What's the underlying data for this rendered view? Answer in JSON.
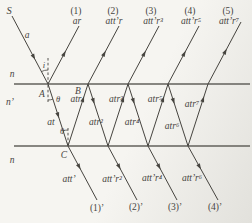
{
  "diagram": {
    "width": 252,
    "height": 223,
    "background": "#f6f5f1",
    "background_edge": "#e2e1dc",
    "ink": "#46443f",
    "surface_color": "#62605b",
    "surfaces": [
      {
        "name": "top-interface-line",
        "x1": 14,
        "y1": 84,
        "x2": 250,
        "y2": 84
      },
      {
        "name": "bottom-interface-line",
        "x1": 14,
        "y1": 146,
        "x2": 250,
        "y2": 146
      }
    ],
    "normals": [
      {
        "name": "normal-above-A",
        "x1": 48,
        "y1": 58,
        "x2": 48,
        "y2": 83
      },
      {
        "name": "normal-below-A",
        "x1": 48,
        "y1": 85,
        "x2": 48,
        "y2": 102
      },
      {
        "name": "normal-above-C",
        "x1": 68,
        "y1": 128,
        "x2": 68,
        "y2": 145
      }
    ],
    "arcs": [
      {
        "name": "incidence-angle-arc",
        "x1": 41.4,
        "y1": 71.6,
        "x2": 48,
        "y2": 70,
        "r": 14,
        "sweep": 1
      },
      {
        "name": "refraction-angle-arc-A",
        "x1": 48,
        "y1": 100,
        "x2": 52.9,
        "y2": 99.2,
        "r": 16,
        "sweep": 0
      },
      {
        "name": "refraction-angle-arc-C",
        "x1": 63.1,
        "y1": 130.8,
        "x2": 68,
        "y2": 130,
        "r": 16,
        "sweep": 1
      }
    ],
    "rays": [
      {
        "name": "incident-ray",
        "x1": 12,
        "y1": 16,
        "x2": 48,
        "y2": 84,
        "arrow_t": 0.6
      },
      {
        "name": "reflected-ray-1",
        "x1": 48,
        "y1": 84,
        "x2": 79,
        "y2": 26,
        "arrow_t": 0.52
      },
      {
        "name": "reflected-ray-2",
        "x1": 88,
        "y1": 84,
        "x2": 119,
        "y2": 26,
        "arrow_t": 0.52
      },
      {
        "name": "reflected-ray-3",
        "x1": 128,
        "y1": 84,
        "x2": 159,
        "y2": 26,
        "arrow_t": 0.52
      },
      {
        "name": "reflected-ray-4",
        "x1": 168,
        "y1": 84,
        "x2": 199,
        "y2": 26,
        "arrow_t": 0.52
      },
      {
        "name": "reflected-ray-5",
        "x1": 208,
        "y1": 84,
        "x2": 241,
        "y2": 22,
        "arrow_t": 0.52
      },
      {
        "name": "internal-ray-down-1",
        "x1": 48,
        "y1": 84,
        "x2": 68,
        "y2": 146,
        "arrow_t": 0.5
      },
      {
        "name": "internal-ray-up-1",
        "x1": 68,
        "y1": 146,
        "x2": 88,
        "y2": 84,
        "arrow_t": 0.75
      },
      {
        "name": "internal-ray-down-2",
        "x1": 88,
        "y1": 84,
        "x2": 108,
        "y2": 146,
        "arrow_t": 0.27
      },
      {
        "name": "internal-ray-up-2",
        "x1": 108,
        "y1": 146,
        "x2": 128,
        "y2": 84,
        "arrow_t": 0.75
      },
      {
        "name": "internal-ray-down-3",
        "x1": 128,
        "y1": 84,
        "x2": 148,
        "y2": 146,
        "arrow_t": 0.27
      },
      {
        "name": "internal-ray-up-3",
        "x1": 148,
        "y1": 146,
        "x2": 168,
        "y2": 84,
        "arrow_t": 0.75
      },
      {
        "name": "internal-ray-down-4",
        "x1": 168,
        "y1": 84,
        "x2": 188,
        "y2": 146,
        "arrow_t": 0.27
      },
      {
        "name": "internal-ray-up-4",
        "x1": 188,
        "y1": 146,
        "x2": 208,
        "y2": 84,
        "arrow_t": 0.75
      },
      {
        "name": "transmitted-ray-1",
        "x1": 68,
        "y1": 146,
        "x2": 97,
        "y2": 200,
        "arrow_t": 0.38
      },
      {
        "name": "transmitted-ray-2",
        "x1": 108,
        "y1": 146,
        "x2": 137,
        "y2": 200,
        "arrow_t": 0.38
      },
      {
        "name": "transmitted-ray-3",
        "x1": 148,
        "y1": 146,
        "x2": 177,
        "y2": 200,
        "arrow_t": 0.38
      },
      {
        "name": "transmitted-ray-4",
        "x1": 188,
        "y1": 146,
        "x2": 218,
        "y2": 200,
        "arrow_t": 0.38
      }
    ],
    "labels": [
      {
        "name": "source-label",
        "text": "S",
        "x": 9,
        "y": 14,
        "size": 10.5
      },
      {
        "name": "incident-amplitude-label",
        "text": "a",
        "x": 27,
        "y": 38
      },
      {
        "name": "medium-n-top-label",
        "text": "n",
        "x": 12,
        "y": 77
      },
      {
        "name": "film-index-label",
        "text": "n’",
        "x": 10,
        "y": 105
      },
      {
        "name": "medium-n-bottom-label",
        "text": "n",
        "x": 12,
        "y": 163
      },
      {
        "name": "point-A-label",
        "text": "A",
        "x": 42,
        "y": 97
      },
      {
        "name": "point-B-label",
        "text": "B",
        "x": 78,
        "y": 94
      },
      {
        "name": "point-C-label",
        "text": "C",
        "x": 64,
        "y": 158
      },
      {
        "name": "incidence-angle-label",
        "text": "i",
        "x": 44,
        "y": 68,
        "size": 8.5
      },
      {
        "name": "refraction-angle-label-A",
        "text": "θ",
        "x": 58,
        "y": 102,
        "size": 8.5
      },
      {
        "name": "refraction-angle-label-C",
        "text": "θ",
        "x": 62,
        "y": 134,
        "size": 8.5
      },
      {
        "name": "internal-amplitude-at",
        "text": "at",
        "x": 51,
        "y": 125
      },
      {
        "name": "internal-amplitude-atr",
        "text": "atr",
        "x": 76,
        "y": 102
      },
      {
        "name": "internal-amplitude-atr2",
        "text": "atr²",
        "x": 96,
        "y": 125
      },
      {
        "name": "internal-amplitude-atr3",
        "text": "atr³",
        "x": 116,
        "y": 102
      },
      {
        "name": "internal-amplitude-atr4",
        "text": "atr⁴",
        "x": 132,
        "y": 125
      },
      {
        "name": "internal-amplitude-atr5",
        "text": "atr⁵",
        "x": 155,
        "y": 102
      },
      {
        "name": "internal-amplitude-atr6",
        "text": "atr⁶",
        "x": 172,
        "y": 129
      },
      {
        "name": "internal-amplitude-atr7",
        "text": "atr⁷",
        "x": 192,
        "y": 107
      },
      {
        "name": "reflected-order-1-label",
        "text": "(1)",
        "x": 76,
        "y": 14,
        "italic": false
      },
      {
        "name": "reflected-amplitude-1-label",
        "text": "ar",
        "x": 77,
        "y": 24
      },
      {
        "name": "reflected-order-2-label",
        "text": "(2)",
        "x": 113,
        "y": 14,
        "italic": false
      },
      {
        "name": "reflected-amplitude-2-label",
        "text": "att’r",
        "x": 114,
        "y": 24
      },
      {
        "name": "reflected-order-3-label",
        "text": "(3)",
        "x": 151,
        "y": 14,
        "italic": false
      },
      {
        "name": "reflected-amplitude-3-label",
        "text": "att’r³",
        "x": 153,
        "y": 24
      },
      {
        "name": "reflected-order-4-label",
        "text": "(4)",
        "x": 190,
        "y": 14,
        "italic": false
      },
      {
        "name": "reflected-amplitude-4-label",
        "text": "att’r⁵",
        "x": 191,
        "y": 24
      },
      {
        "name": "reflected-order-5-label",
        "text": "(5)",
        "x": 228,
        "y": 14,
        "italic": false
      },
      {
        "name": "reflected-amplitude-5-label",
        "text": "att’r⁷",
        "x": 229,
        "y": 24
      },
      {
        "name": "transmitted-amplitude-1-label",
        "text": "att’",
        "x": 69,
        "y": 182
      },
      {
        "name": "transmitted-amplitude-2-label",
        "text": "att’r²",
        "x": 112,
        "y": 182
      },
      {
        "name": "transmitted-amplitude-3-label",
        "text": "att’r⁴",
        "x": 152,
        "y": 181
      },
      {
        "name": "transmitted-amplitude-4-label",
        "text": "att’r⁶",
        "x": 192,
        "y": 181
      },
      {
        "name": "transmitted-order-1-label",
        "text": "(1)’",
        "x": 97,
        "y": 211,
        "italic": false
      },
      {
        "name": "transmitted-order-2-label",
        "text": "(2)’",
        "x": 136,
        "y": 210,
        "italic": false
      },
      {
        "name": "transmitted-order-3-label",
        "text": "(3)’",
        "x": 175,
        "y": 210,
        "italic": false
      },
      {
        "name": "transmitted-order-4-label",
        "text": "(4)’",
        "x": 215,
        "y": 210,
        "italic": false
      }
    ]
  }
}
